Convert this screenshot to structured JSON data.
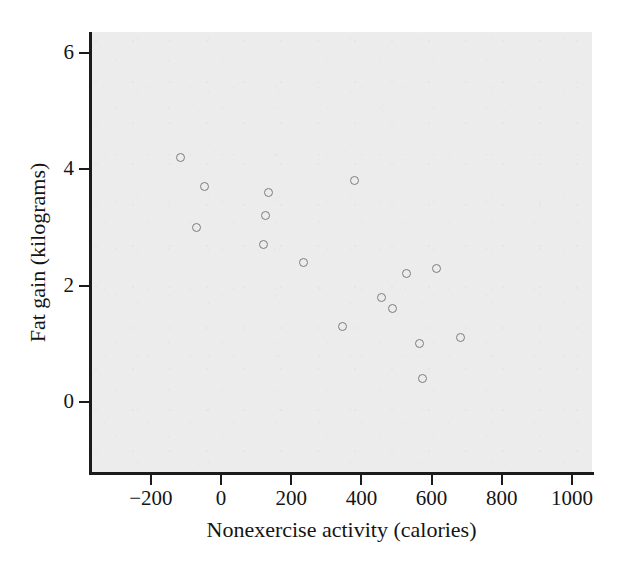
{
  "chart_data": {
    "type": "scatter",
    "title": "",
    "xlabel": "Nonexercise activity (calories)",
    "ylabel": "Fat gain (kilograms)",
    "xlim": [
      -320,
      1060
    ],
    "ylim": [
      -0.75,
      6.3
    ],
    "xticks": [
      -200,
      0,
      200,
      400,
      600,
      800,
      1000
    ],
    "xtick_labels": [
      "−200",
      "0",
      "200",
      "400",
      "600",
      "800",
      "1000"
    ],
    "yticks": [
      0,
      2,
      4,
      6
    ],
    "ytick_labels": [
      "0",
      "2",
      "4",
      "6"
    ],
    "grid": false,
    "legend": null,
    "marker": "open-circle",
    "marker_color": "#7c7c7c",
    "plot_background": "#ececec",
    "axis_color": "#1b1b1b",
    "points": [
      {
        "x": -116,
        "y": 4.2
      },
      {
        "x": -70,
        "y": 3.0
      },
      {
        "x": -46,
        "y": 3.7
      },
      {
        "x": 120,
        "y": 2.7
      },
      {
        "x": 128,
        "y": 3.2
      },
      {
        "x": 135,
        "y": 3.6
      },
      {
        "x": 234,
        "y": 2.4
      },
      {
        "x": 345,
        "y": 1.3
      },
      {
        "x": 380,
        "y": 3.8
      },
      {
        "x": 458,
        "y": 1.8
      },
      {
        "x": 488,
        "y": 1.6
      },
      {
        "x": 528,
        "y": 2.2
      },
      {
        "x": 566,
        "y": 1.0
      },
      {
        "x": 575,
        "y": 0.4
      },
      {
        "x": 614,
        "y": 2.3
      },
      {
        "x": 681,
        "y": 1.1
      }
    ]
  }
}
